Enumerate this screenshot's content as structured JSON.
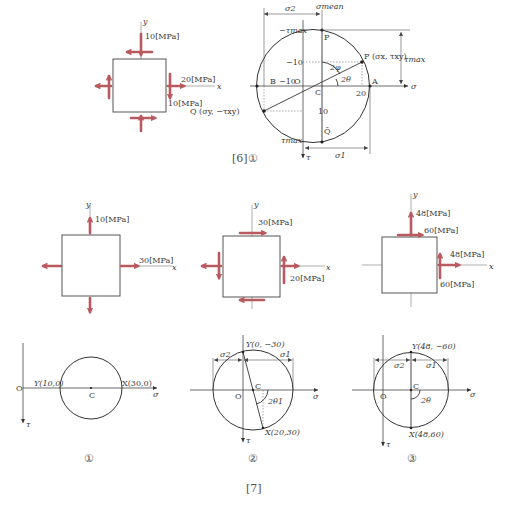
{
  "figure6": {
    "caption": "[6]①",
    "element": {
      "y_axis": "y",
      "x_axis": "x",
      "top_label": "10[MPa]",
      "right_label_normal": "20[MPa]",
      "right_label_shear": "10[MPa]"
    },
    "mohr": {
      "sigma_mean": "σmean",
      "sigma_2": "σ2",
      "sigma_1": "σ1",
      "neg_tau_max": "−τmax",
      "tau_max_bottom": "τmax",
      "tau_max_right": "τmax",
      "point_P_label": "P",
      "point_P_coord": "P (σx, τxy)",
      "point_Q_coord": "Q (σy, −τxy)",
      "point_Q_bar": "Q̄",
      "point_B": "B",
      "point_A": "A",
      "point_C": "C",
      "origin": "O",
      "tick_neg10_x": "−10",
      "tick_20_x": "20",
      "tick_neg10_y": "−10",
      "tick_10_y": "10",
      "angle_2phi": "2φ",
      "angle_2theta": "2θ",
      "axis_sigma": "σ",
      "axis_tau": "τ"
    }
  },
  "figure7": {
    "caption": "[7]",
    "cases": [
      {
        "label": "①",
        "element": {
          "y_axis": "y",
          "x_axis": "x",
          "top_label": "10[MPa]",
          "right_label": "30[MPa]"
        },
        "mohr": {
          "origin": "O",
          "center": "C",
          "point_Y": "Y(10,0)",
          "point_X": "X(30,0)",
          "axis_sigma": "σ",
          "axis_tau": "τ"
        }
      },
      {
        "label": "②",
        "element": {
          "y_axis": "y",
          "x_axis": "x",
          "top_label": "30[MPa]",
          "right_label": "20[MPa]"
        },
        "mohr": {
          "origin": "O",
          "center": "C",
          "point_Y": "Y(0, −30)",
          "point_X": "X(20,30)",
          "sigma_2": "σ2",
          "sigma_1": "σ1",
          "angle": "2θ1",
          "axis_sigma": "σ",
          "axis_tau": "τ"
        }
      },
      {
        "label": "③",
        "element": {
          "y_axis": "y",
          "x_axis": "x",
          "top_normal_label": "48[MPa]",
          "top_shear_label": "60[MPa]",
          "right_normal_label": "48[MPa]",
          "right_shear_label": "60[MPa]"
        },
        "mohr": {
          "origin": "O",
          "center": "C",
          "point_Y": "Y(48, −60)",
          "point_X": "X(48,60)",
          "sigma_2": "σ2",
          "sigma_1": "σ1",
          "angle": "2θ",
          "axis_sigma": "σ",
          "axis_tau": "τ"
        }
      }
    ]
  },
  "colors": {
    "arrow": "#b85a5f",
    "line": "#333333",
    "axis": "#9a9a9a"
  }
}
